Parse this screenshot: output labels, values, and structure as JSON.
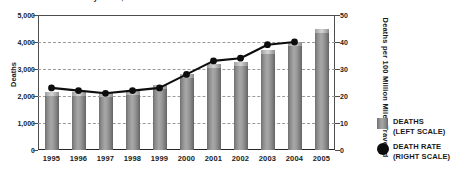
{
  "chart_data": {
    "type": "bar",
    "title": "Fatalities and Fatality Rates, 1995-2005",
    "categories": [
      "1995",
      "1996",
      "1997",
      "1998",
      "1999",
      "2000",
      "2001",
      "2002",
      "2003",
      "2004",
      "2005"
    ],
    "series": [
      {
        "name": "DEATHS",
        "type": "bar",
        "axis": "left",
        "values": [
          2150,
          2150,
          2100,
          2200,
          2400,
          2800,
          3200,
          3250,
          3700,
          4000,
          4500
        ]
      },
      {
        "name": "DEATH RATE",
        "type": "line",
        "axis": "right",
        "values": [
          23,
          22,
          21,
          22,
          23,
          28,
          33,
          34,
          39,
          40,
          null
        ]
      }
    ],
    "xlabel": "",
    "ylabel": "Deaths",
    "ylabel_right": "Deaths per 100 Million Miles Traveled",
    "ylim": [
      0,
      5000
    ],
    "ylim_right": [
      0,
      50
    ],
    "yticks": [
      "0",
      "1,000",
      "2,000",
      "3,000",
      "4,000",
      "5,000"
    ],
    "ytick_values": [
      0,
      1000,
      2000,
      3000,
      4000,
      5000
    ],
    "yticks_right": [
      "0",
      "10",
      "20",
      "30",
      "40",
      "50"
    ],
    "ytick_values_right": [
      0,
      10,
      20,
      30,
      40,
      50
    ],
    "grid": true,
    "grid_style": "dashed-horizontal",
    "legend_position": "right",
    "legend": [
      {
        "label_line1": "DEATHS",
        "label_line2": "(LEFT SCALE)",
        "marker": "square",
        "color": "#8d8d8d"
      },
      {
        "label_line1": "DEATH RATE",
        "label_line2": "(RIGHT SCALE)",
        "marker": "circle",
        "color": "#0d0d0d"
      }
    ],
    "colors": {
      "bar": "#8d8d8d",
      "line": "#0d0d0d",
      "grid": "#9a9a9a",
      "axis": "#4d4d4d",
      "background": "#ffffff",
      "text": "#1a1a1a"
    }
  }
}
